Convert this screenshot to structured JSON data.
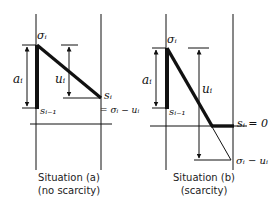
{
  "colors": {
    "ink": "#111111",
    "background": "#ffffff"
  },
  "panel_a": {
    "caption_line1": "Situation (a)",
    "caption_line2": "(no scarcity)",
    "label_sigma": "σᵢ",
    "label_a": "aᵢ",
    "label_u": "uᵢ",
    "label_s_prev": "sᵢ₋₁",
    "label_s": "sᵢ",
    "label_s_eq": "= σᵢ − uᵢ"
  },
  "panel_b": {
    "caption_line1": "Situation (b)",
    "caption_line2": "(scarcity)",
    "label_sigma": "σᵢ",
    "label_a": "aᵢ",
    "label_u": "uᵢ",
    "label_s_prev": "sᵢ₋₁",
    "label_s_zero": "sᵢ = 0",
    "label_sigma_minus_u": "σᵢ − uᵢ"
  }
}
